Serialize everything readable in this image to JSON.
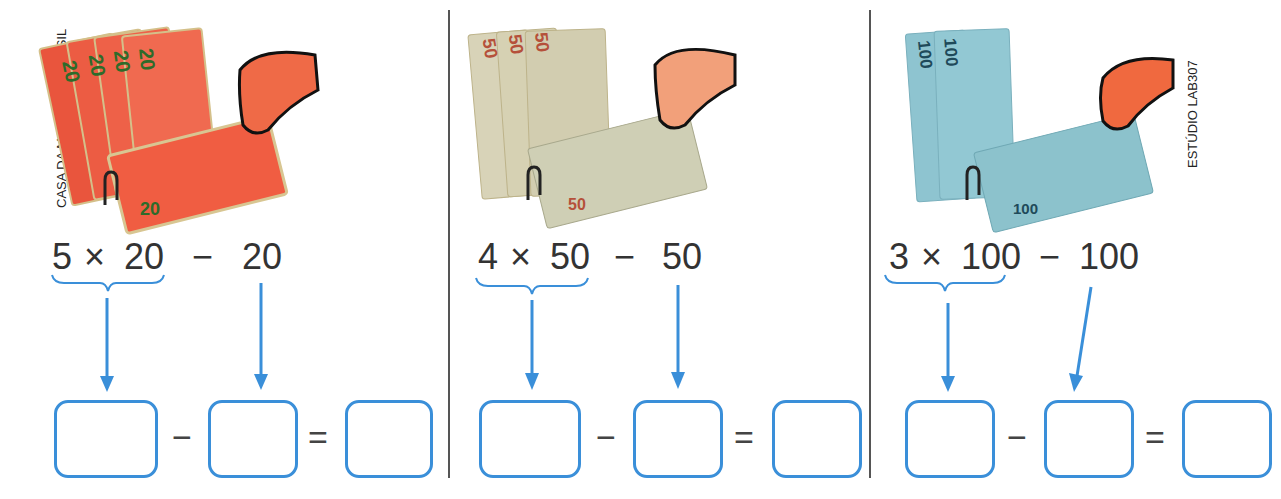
{
  "credits": {
    "left": "CASA DA MOEDA DO BRASIL",
    "right": "ESTÚDIO LAB307"
  },
  "colors": {
    "accent": "#3a8fd9",
    "text": "#333333",
    "divider": "#555555"
  },
  "panels": [
    {
      "note_value": "20",
      "note_count": 5,
      "note_color": "#e8553d",
      "expression": {
        "count": "5",
        "times": "×",
        "value": "20",
        "minus": "−",
        "subtrahend": "20"
      },
      "answer_ops": {
        "minus": "−",
        "equals": "="
      },
      "boxes": [
        "",
        "",
        ""
      ]
    },
    {
      "note_value": "50",
      "note_count": 4,
      "note_color": "#c9c3a5",
      "expression": {
        "count": "4",
        "times": "×",
        "value": "50",
        "minus": "−",
        "subtrahend": "50"
      },
      "answer_ops": {
        "minus": "−",
        "equals": "="
      },
      "boxes": [
        "",
        "",
        ""
      ]
    },
    {
      "note_value": "100",
      "note_count": 3,
      "note_color": "#8fc3cf",
      "expression": {
        "count": "3",
        "times": "×",
        "value": "100",
        "minus": "−",
        "subtrahend": "100"
      },
      "answer_ops": {
        "minus": "−",
        "equals": "="
      },
      "boxes": [
        "",
        "",
        ""
      ]
    }
  ]
}
